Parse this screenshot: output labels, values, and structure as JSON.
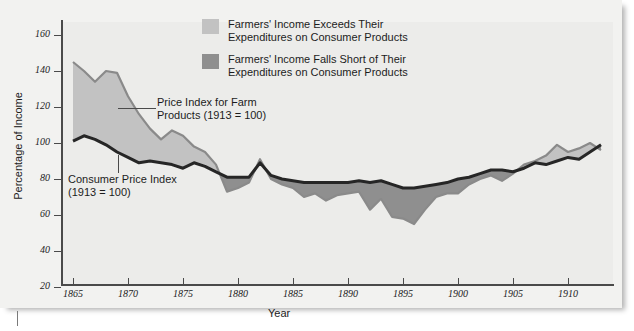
{
  "chart_data": {
    "type": "area",
    "title": "",
    "xlabel": "Year",
    "ylabel": "Percentage of Income",
    "xlim": [
      1864,
      1913
    ],
    "ylim": [
      10,
      170
    ],
    "yticks": [
      20,
      40,
      60,
      80,
      100,
      120,
      140,
      160
    ],
    "xticks": [
      1865,
      1870,
      1875,
      1880,
      1885,
      1890,
      1895,
      1900,
      1905,
      1910
    ],
    "grid": false,
    "legend_position": "top-center",
    "x": [
      1865,
      1866,
      1867,
      1868,
      1869,
      1870,
      1871,
      1872,
      1873,
      1874,
      1875,
      1876,
      1877,
      1878,
      1879,
      1880,
      1881,
      1882,
      1883,
      1884,
      1885,
      1886,
      1887,
      1888,
      1889,
      1890,
      1891,
      1892,
      1893,
      1894,
      1895,
      1896,
      1897,
      1898,
      1899,
      1900,
      1901,
      1902,
      1903,
      1904,
      1905,
      1906,
      1907,
      1908,
      1909,
      1910,
      1911,
      1912,
      1913
    ],
    "series": [
      {
        "name": "Price Index for Farm Products (1913 = 100)",
        "color": "#8a8a8a",
        "values": [
          145,
          140,
          134,
          140,
          139,
          126,
          116,
          108,
          102,
          107,
          104,
          98,
          95,
          88,
          73,
          75,
          78,
          91,
          80,
          77,
          75,
          70,
          72,
          68,
          71,
          72,
          73,
          63,
          69,
          59,
          58,
          55,
          63,
          70,
          72,
          72,
          77,
          80,
          82,
          79,
          83,
          88,
          90,
          93,
          99,
          95,
          97,
          100,
          96
        ]
      },
      {
        "name": "Consumer Price Index (1913 = 100)",
        "color": "#262626",
        "values": [
          101,
          104,
          102,
          99,
          95,
          92,
          89,
          90,
          89,
          88,
          86,
          89,
          87,
          84,
          81,
          81,
          81,
          89,
          82,
          80,
          79,
          78,
          78,
          78,
          78,
          78,
          79,
          78,
          79,
          77,
          75,
          75,
          76,
          77,
          78,
          80,
          81,
          83,
          85,
          85,
          84,
          86,
          89,
          88,
          90,
          92,
          91,
          95,
          99
        ]
      }
    ],
    "fill_rules": [
      {
        "name": "Farmers' Income Exceeds Their Expenditures on Consumer Products",
        "color": "#c2c2c2",
        "condition": "farm_above_cpi"
      },
      {
        "name": "Farmers' Income Falls Short of Their Expenditures on Consumer Products",
        "color": "#8f8f8f",
        "condition": "farm_below_cpi"
      }
    ],
    "annotations": [
      {
        "id": "farm-label",
        "text_line1": "Price Index for Farm",
        "text_line2": "Products (1913 = 100)"
      },
      {
        "id": "cpi-label",
        "text_line1": "Consumer Price Index",
        "text_line2": "(1913 = 100)"
      }
    ]
  },
  "legend": {
    "items": [
      {
        "swatch": "light",
        "line1": "Farmers' Income Exceeds Their",
        "line2": "Expenditures on Consumer Products"
      },
      {
        "swatch": "dark",
        "line1": "Farmers' Income Falls Short of Their",
        "line2": "Expenditures on Consumer Products"
      }
    ]
  },
  "axes": {
    "x_title": "Year",
    "y_title": "Percentage of Income",
    "y_ticks": [
      "160",
      "140",
      "120",
      "100",
      "80",
      "60",
      "40",
      "20"
    ],
    "x_ticks": [
      "1865",
      "1870",
      "1875",
      "1880",
      "1885",
      "1890",
      "1895",
      "1900",
      "1905",
      "1910"
    ]
  },
  "annotations": {
    "farm_l1": "Price Index for Farm",
    "farm_l2": "Products (1913 = 100)",
    "cpi_l1": "Consumer Price Index",
    "cpi_l2": "(1913 = 100)"
  },
  "colors": {
    "panel_bg": "#f2f2f0",
    "plot_bg": "#ececea",
    "fill_above": "#c2c2c2",
    "fill_below": "#8f8f8f",
    "farm_line": "#8a8a8a",
    "cpi_line": "#262626",
    "axis": "#4a4a4a"
  }
}
